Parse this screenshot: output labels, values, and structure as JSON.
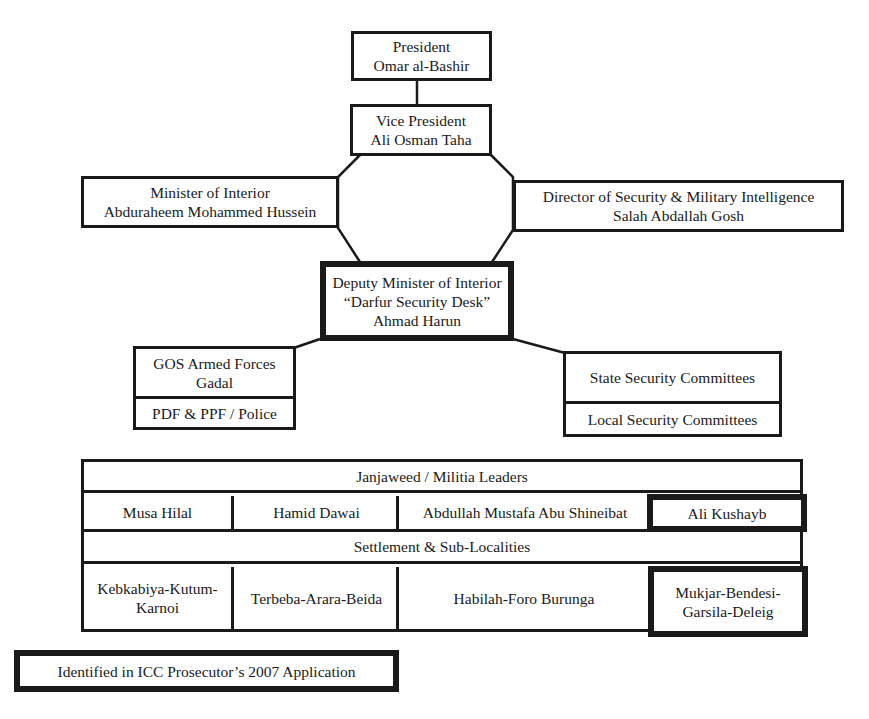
{
  "hierarchy": {
    "president": {
      "title": "President",
      "name": "Omar al-Bashir"
    },
    "vice_president": {
      "title": "Vice President",
      "name": "Ali Osman Taha"
    },
    "minister_interior": {
      "title": "Minister of Interior",
      "name": "Abduraheem Mohammed Hussein"
    },
    "director_security": {
      "title": "Director of Security & Military Intelligence",
      "name": "Salah Abdallah Gosh"
    },
    "deputy_minister": {
      "title": "Deputy Minister of Interior",
      "subtitle": "“Darfur Security Desk”",
      "name": "Ahmad Harun"
    },
    "armed_forces": {
      "title": "GOS Armed Forces",
      "name": "Gadal",
      "sub": "PDF & PPF / Police"
    },
    "committees": {
      "state": "State Security Committees",
      "local": "Local Security Committees"
    }
  },
  "militia_table": {
    "header": "Janjaweed / Militia Leaders",
    "leaders": [
      {
        "name": "Musa Hilal",
        "identified": false
      },
      {
        "name": "Hamid Dawai",
        "identified": false
      },
      {
        "name": "Abdullah Mustafa Abu Shineibat",
        "identified": false
      },
      {
        "name": "Ali Kushayb",
        "identified": true
      }
    ],
    "settlement_header": "Settlement & Sub-Localities",
    "settlements": [
      {
        "line1": "Kebkabiya-Kutum-",
        "line2": "Karnoi",
        "identified": false
      },
      {
        "line1": "Terbeba-Arara-Beida",
        "line2": "",
        "identified": false
      },
      {
        "line1": "Habilah-Foro Burunga",
        "line2": "",
        "identified": false
      },
      {
        "line1": "Mukjar-Bendesi-",
        "line2": "Garsila-Deleig",
        "identified": true
      }
    ]
  },
  "legend": {
    "label": "Identified in ICC Prosecutor’s 2007 Application"
  },
  "colors": {
    "ink": "#1a1a1a",
    "background": "#ffffff"
  }
}
